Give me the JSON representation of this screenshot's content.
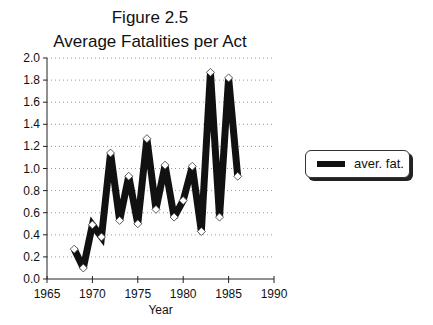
{
  "chart_data": {
    "type": "line",
    "title": "Figure 2.5",
    "subtitle": "Average Fatalities per Act",
    "xlabel": "Year",
    "ylabel": "",
    "xlim": [
      1965,
      1990
    ],
    "ylim": [
      0.0,
      2.0
    ],
    "x_ticks": [
      "1965",
      "1970",
      "1975",
      "1980",
      "1985",
      "1990"
    ],
    "y_ticks": [
      "0.0",
      "0.2",
      "0.4",
      "0.6",
      "0.8",
      "1.0",
      "1.2",
      "1.4",
      "1.6",
      "1.8",
      "2.0"
    ],
    "grid": "horizontal dotted",
    "legend_position": "right",
    "x": [
      1968,
      1969,
      1970,
      1971,
      1972,
      1973,
      1974,
      1975,
      1976,
      1977,
      1978,
      1979,
      1980,
      1981,
      1982,
      1983,
      1984,
      1985,
      1986
    ],
    "series": [
      {
        "name": "aver. fat.",
        "values": [
          0.27,
          0.1,
          0.49,
          0.38,
          1.14,
          0.53,
          0.93,
          0.5,
          1.27,
          0.63,
          1.03,
          0.56,
          0.71,
          1.02,
          0.43,
          1.87,
          0.56,
          1.82,
          0.93
        ]
      }
    ]
  },
  "legend": {
    "label": "aver. fat."
  }
}
